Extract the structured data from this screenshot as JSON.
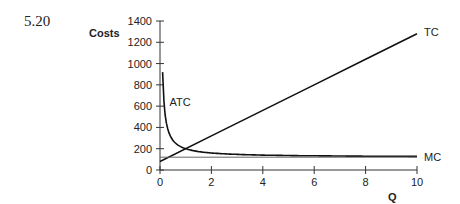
{
  "figure": {
    "number": "5.20"
  },
  "chart_data": {
    "type": "line",
    "title": "",
    "xlabel": "Q",
    "ylabel": "Costs",
    "xlim": [
      0,
      10
    ],
    "ylim": [
      0,
      1400
    ],
    "x_ticks": [
      0,
      2,
      4,
      6,
      8,
      10
    ],
    "y_ticks": [
      0,
      200,
      400,
      600,
      800,
      1000,
      1200,
      1400
    ],
    "grid": false,
    "legend": "inline labels at curve ends",
    "series": [
      {
        "name": "TC",
        "label_position": "end",
        "x": [
          0,
          2,
          4,
          6,
          8,
          10
        ],
        "values": [
          80,
          320,
          560,
          800,
          1040,
          1280
        ]
      },
      {
        "name": "ATC",
        "label_position": "start",
        "x": [
          0.1,
          0.2,
          0.5,
          1,
          2,
          4,
          6,
          8,
          10
        ],
        "values": [
          920,
          520,
          280,
          200,
          160,
          140,
          133,
          130,
          128
        ]
      },
      {
        "name": "MC",
        "label_position": "end",
        "x": [
          0,
          10
        ],
        "values": [
          120,
          120
        ]
      }
    ]
  }
}
